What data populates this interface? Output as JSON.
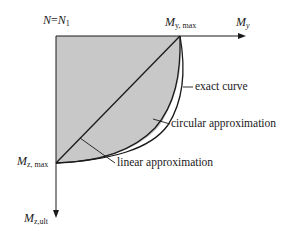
{
  "diagram": {
    "axes": {
      "origin_label_main": "N",
      "origin_label_eq": "=",
      "origin_label_rhs": "N",
      "origin_label_rhs_sub": "1",
      "x_axis_label": "M",
      "x_axis_label_sub": "y",
      "y_axis_label": "M",
      "y_axis_label_sub": "z,ult",
      "x_max_label": "M",
      "x_max_label_sub": "y, max",
      "y_max_label": "M",
      "y_max_label_sub": "z, max"
    },
    "curves": {
      "exact_label": "exact curve",
      "circular_label": "circular approximation",
      "linear_label": "linear approximation"
    },
    "colors": {
      "fill": "#c8c8c8",
      "stroke": "#1a1a1a"
    }
  }
}
